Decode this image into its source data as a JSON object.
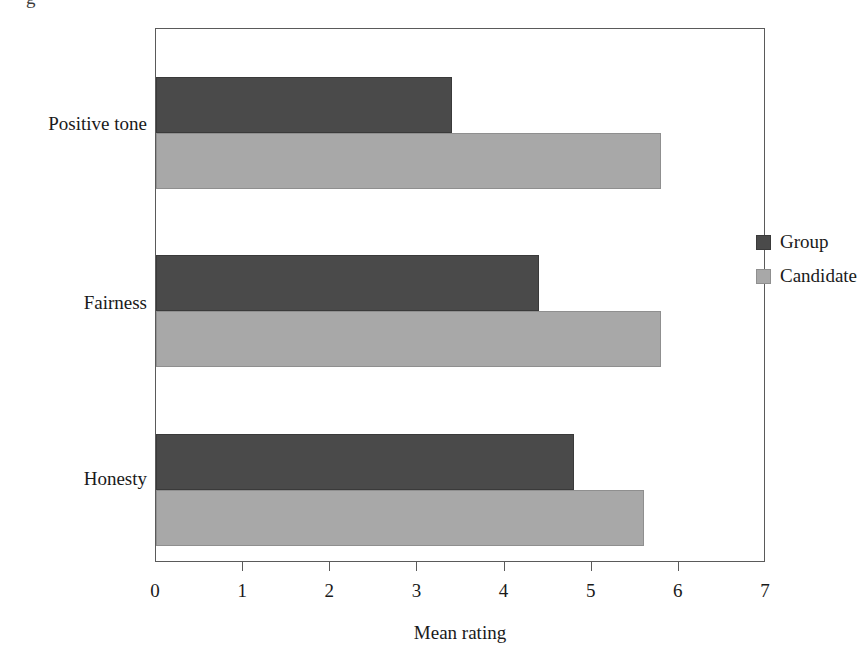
{
  "caption_fragment": "g",
  "chart_data": {
    "type": "bar",
    "orientation": "horizontal",
    "title": "",
    "xlabel": "Mean rating",
    "ylabel": "",
    "categories": [
      "Honesty",
      "Fairness",
      "Positive tone"
    ],
    "series": [
      {
        "name": "Group",
        "color": "#4a4a4a",
        "values": [
          4.8,
          4.4,
          3.4
        ]
      },
      {
        "name": "Candidate",
        "color": "#a8a8a8",
        "values": [
          5.6,
          5.8,
          5.8
        ]
      }
    ],
    "xlim": [
      0,
      7
    ],
    "xticks": [
      "0",
      "1",
      "2",
      "3",
      "4",
      "5",
      "6",
      "7"
    ],
    "grid": false,
    "legend_position": "upper-right-inside",
    "frame": true
  },
  "legend": {
    "entries": [
      {
        "label": "Group",
        "swatch": "group"
      },
      {
        "label": "Candidate",
        "swatch": "candidate"
      }
    ]
  },
  "axis": {
    "x_title": "Mean rating",
    "tick_labels": [
      "0",
      "1",
      "2",
      "3",
      "4",
      "5",
      "6",
      "7"
    ],
    "category_labels": [
      "Positive tone",
      "Fairness",
      "Honesty"
    ]
  }
}
